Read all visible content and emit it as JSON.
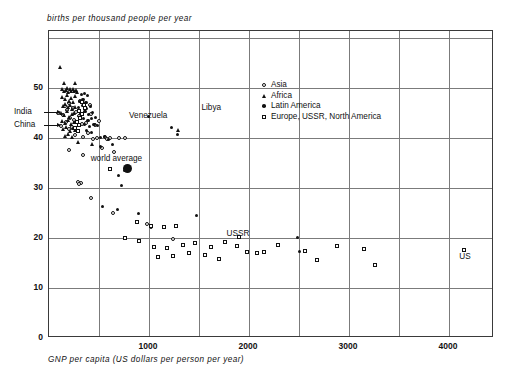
{
  "chart_data": {
    "type": "scatter",
    "title": "",
    "ylabel": "births per thousand people per year",
    "xlabel": "GNP per capita (US dollars per person per year)",
    "xlim": [
      0,
      4450
    ],
    "ylim": [
      0,
      61.4
    ],
    "xticks": [
      1000,
      2000,
      3000,
      4000
    ],
    "xtick_labels": [
      "1000",
      "2000",
      "3000",
      "4000"
    ],
    "yticks": [
      0,
      10,
      20,
      30,
      40,
      50
    ],
    "ytick_labels": [
      "0",
      "10",
      "20",
      "30",
      "40",
      "50"
    ],
    "grid": "both-500x10",
    "grid_x_step": 500,
    "grid_y_step": 10,
    "legend_position": "upper-right-inside",
    "legend": [
      {
        "label": "Asia",
        "marker": "open-circle",
        "group": "asia"
      },
      {
        "label": "Africa",
        "marker": "filled-triangle",
        "group": "africa"
      },
      {
        "label": "Latin America",
        "marker": "filled-circle",
        "group": "latin"
      },
      {
        "label": "Europe, USSR, North America",
        "marker": "open-square",
        "group": "europe"
      }
    ],
    "annotations": [
      {
        "text": "India",
        "x": 90,
        "y": 45.0,
        "arrow": true
      },
      {
        "text": "China",
        "x": 90,
        "y": 42.4,
        "arrow": true
      },
      {
        "text": "Venezuela",
        "x": 1000,
        "y": 44.2,
        "arrow": false
      },
      {
        "text": "Libya",
        "x": 1640,
        "y": 45.8,
        "arrow": false
      },
      {
        "text": "world average",
        "x": 700,
        "y": 35.6,
        "arrow": false
      },
      {
        "text": "USSR",
        "x": 1870,
        "y": 20.6,
        "arrow": false
      },
      {
        "text": "US",
        "x": 4155,
        "y": 16.0,
        "arrow": false
      }
    ],
    "series": [
      {
        "name": "Asia",
        "marker": "open-circle",
        "points": [
          [
            95,
            45.0
          ],
          [
            120,
            42.4
          ],
          [
            145,
            44.6
          ],
          [
            160,
            46.4
          ],
          [
            175,
            43.2
          ],
          [
            185,
            45.6
          ],
          [
            200,
            41.8
          ],
          [
            205,
            47.0
          ],
          [
            215,
            44.0
          ],
          [
            230,
            42.2
          ],
          [
            245,
            46.0
          ],
          [
            255,
            43.6
          ],
          [
            265,
            40.6
          ],
          [
            275,
            45.2
          ],
          [
            290,
            41.4
          ],
          [
            300,
            44.4
          ],
          [
            315,
            47.4
          ],
          [
            330,
            42.8
          ],
          [
            345,
            40.2
          ],
          [
            360,
            45.8
          ],
          [
            375,
            43.0
          ],
          [
            390,
            41.0
          ],
          [
            410,
            46.6
          ],
          [
            425,
            44.8
          ],
          [
            440,
            39.8
          ],
          [
            460,
            42.6
          ],
          [
            485,
            40.0
          ],
          [
            505,
            43.4
          ],
          [
            530,
            38.0
          ],
          [
            560,
            40.2
          ],
          [
            585,
            39.8
          ],
          [
            610,
            40.0
          ],
          [
            650,
            37.2
          ],
          [
            700,
            40.0
          ],
          [
            760,
            40.0
          ],
          [
            200,
            37.6
          ],
          [
            340,
            36.6
          ],
          [
            290,
            31.2
          ],
          [
            320,
            31.0
          ],
          [
            305,
            30.8
          ],
          [
            420,
            28.0
          ],
          [
            980,
            22.8
          ],
          [
            1020,
            22.2
          ],
          [
            640,
            25.0
          ],
          [
            1240,
            19.8
          ]
        ]
      },
      {
        "name": "Africa",
        "marker": "filled-triangle",
        "points": [
          [
            110,
            54.2
          ],
          [
            155,
            51.0
          ],
          [
            260,
            51.0
          ],
          [
            130,
            49.8
          ],
          [
            150,
            49.4
          ],
          [
            170,
            49.6
          ],
          [
            185,
            50.0
          ],
          [
            195,
            49.2
          ],
          [
            210,
            49.8
          ],
          [
            225,
            49.4
          ],
          [
            240,
            49.8
          ],
          [
            255,
            49.4
          ],
          [
            270,
            49.6
          ],
          [
            285,
            49.2
          ],
          [
            135,
            48.2
          ],
          [
            160,
            47.8
          ],
          [
            180,
            48.6
          ],
          [
            200,
            47.4
          ],
          [
            220,
            48.0
          ],
          [
            245,
            47.2
          ],
          [
            265,
            48.4
          ],
          [
            140,
            46.4
          ],
          [
            165,
            46.8
          ],
          [
            190,
            46.2
          ],
          [
            215,
            46.6
          ],
          [
            235,
            45.8
          ],
          [
            260,
            46.2
          ],
          [
            125,
            45.0
          ],
          [
            155,
            44.6
          ],
          [
            180,
            45.4
          ],
          [
            205,
            44.2
          ],
          [
            230,
            44.8
          ],
          [
            255,
            45.0
          ],
          [
            135,
            43.4
          ],
          [
            165,
            43.0
          ],
          [
            195,
            43.6
          ],
          [
            225,
            42.8
          ],
          [
            250,
            43.2
          ],
          [
            145,
            41.8
          ],
          [
            175,
            42.2
          ],
          [
            210,
            41.4
          ],
          [
            240,
            42.0
          ],
          [
            265,
            41.6
          ],
          [
            160,
            40.4
          ],
          [
            190,
            40.8
          ],
          [
            230,
            40.2
          ],
          [
            290,
            39.2
          ],
          [
            430,
            38.8
          ],
          [
            1290,
            41.6
          ]
        ]
      },
      {
        "name": "Latin America",
        "marker": "filled-circle",
        "points": [
          [
            330,
            48.6
          ],
          [
            360,
            48.8
          ],
          [
            390,
            48.4
          ],
          [
            310,
            47.2
          ],
          [
            345,
            47.6
          ],
          [
            375,
            47.0
          ],
          [
            300,
            46.0
          ],
          [
            340,
            46.4
          ],
          [
            380,
            45.8
          ],
          [
            420,
            46.2
          ],
          [
            320,
            44.8
          ],
          [
            365,
            45.2
          ],
          [
            400,
            44.6
          ],
          [
            440,
            45.0
          ],
          [
            350,
            43.8
          ],
          [
            395,
            43.4
          ],
          [
            430,
            43.8
          ],
          [
            470,
            44.0
          ],
          [
            360,
            42.6
          ],
          [
            410,
            42.2
          ],
          [
            455,
            42.6
          ],
          [
            490,
            42.4
          ],
          [
            380,
            41.4
          ],
          [
            430,
            41.0
          ],
          [
            520,
            40.0
          ],
          [
            560,
            40.2
          ],
          [
            600,
            39.6
          ],
          [
            520,
            38.2
          ],
          [
            640,
            38.6
          ],
          [
            1230,
            42.0
          ],
          [
            1290,
            40.6
          ],
          [
            1000,
            44.2
          ],
          [
            760,
            33.4
          ],
          [
            700,
            32.4
          ],
          [
            730,
            30.4
          ],
          [
            540,
            26.2
          ],
          [
            690,
            25.6
          ],
          [
            900,
            24.8
          ],
          [
            1480,
            24.4
          ],
          [
            2490,
            20.0
          ],
          [
            2510,
            17.2
          ]
        ]
      },
      {
        "name": "Europe, USSR, North America",
        "marker": "open-square",
        "points": [
          [
            330,
            47.2
          ],
          [
            350,
            46.6
          ],
          [
            360,
            46.0
          ],
          [
            300,
            45.4
          ],
          [
            330,
            44.8
          ],
          [
            310,
            44.0
          ],
          [
            280,
            43.2
          ],
          [
            300,
            42.6
          ],
          [
            260,
            42.0
          ],
          [
            290,
            41.4
          ],
          [
            610,
            33.8
          ],
          [
            880,
            23.2
          ],
          [
            1020,
            22.4
          ],
          [
            1150,
            22.2
          ],
          [
            1270,
            22.4
          ],
          [
            760,
            20.0
          ],
          [
            900,
            19.4
          ],
          [
            1050,
            18.2
          ],
          [
            1180,
            18.0
          ],
          [
            1340,
            18.6
          ],
          [
            1460,
            19.0
          ],
          [
            1620,
            18.2
          ],
          [
            1760,
            19.2
          ],
          [
            1880,
            18.4
          ],
          [
            1900,
            20.2
          ],
          [
            1980,
            17.2
          ],
          [
            2080,
            17.0
          ],
          [
            2150,
            17.2
          ],
          [
            2290,
            18.6
          ],
          [
            2560,
            17.4
          ],
          [
            2680,
            15.6
          ],
          [
            2880,
            18.4
          ],
          [
            3150,
            17.8
          ],
          [
            3260,
            14.6
          ],
          [
            4155,
            17.6
          ],
          [
            1090,
            16.2
          ],
          [
            1240,
            16.4
          ],
          [
            1400,
            17.0
          ],
          [
            1560,
            16.6
          ],
          [
            1700,
            15.8
          ]
        ]
      }
    ],
    "special_points": [
      {
        "name": "world average",
        "x": 780,
        "y": 34.0,
        "marker": "large-filled-circle"
      }
    ]
  }
}
